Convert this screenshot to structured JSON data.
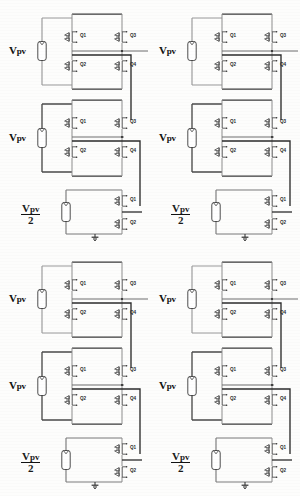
{
  "figure": {
    "background_color": "#fdfdfc",
    "wire_color": "#555555",
    "wire_color_dark": "#2b2b2b",
    "label_color": "#111111",
    "quadrant_count": 4
  },
  "labels": {
    "vpv": "V",
    "vpv_sub": "pv",
    "vpv_full": "Vpv",
    "fraction_numerator": "Vpv",
    "fraction_denominator": "2",
    "q1": "Q1",
    "q2": "Q2",
    "q3": "Q3",
    "q4": "Q4"
  },
  "icons": {
    "ground": "ground-icon",
    "source": "dc-source-icon",
    "mosfet": "mosfet-icon"
  },
  "topologies": [
    {
      "id": "topology-top-left",
      "position": "top-left",
      "stages": [
        {
          "id": "stage-1",
          "type": "full-bridge",
          "source_label": "Vpv",
          "switches": [
            "Q1",
            "Q3",
            "Q2",
            "Q4"
          ]
        },
        {
          "id": "stage-2",
          "type": "full-bridge",
          "source_label": "Vpv",
          "switches": [
            "Q1",
            "Q3",
            "Q2",
            "Q4"
          ]
        },
        {
          "id": "stage-3",
          "type": "half-bridge",
          "source_label": "Vpv/2",
          "switches": [
            "Q1",
            "Q2"
          ],
          "has_ground": true
        }
      ]
    },
    {
      "id": "topology-top-right",
      "position": "top-right",
      "stages": [
        {
          "id": "stage-1",
          "type": "full-bridge",
          "source_label": "Vpv",
          "switches": [
            "Q1",
            "Q3",
            "Q2",
            "Q4"
          ]
        },
        {
          "id": "stage-2",
          "type": "full-bridge",
          "source_label": "Vpv",
          "switches": [
            "Q1",
            "Q3",
            "Q2",
            "Q4"
          ]
        },
        {
          "id": "stage-3",
          "type": "half-bridge",
          "source_label": "Vpv/2",
          "switches": [
            "Q1",
            "Q2"
          ],
          "has_ground": true
        }
      ]
    },
    {
      "id": "topology-bottom-left",
      "position": "bottom-left",
      "stages": [
        {
          "id": "stage-1",
          "type": "full-bridge",
          "source_label": "Vpv",
          "switches": [
            "Q1",
            "Q3",
            "Q2",
            "Q4"
          ]
        },
        {
          "id": "stage-2",
          "type": "full-bridge",
          "source_label": "Vpv",
          "switches": [
            "Q1",
            "Q3",
            "Q2",
            "Q4"
          ]
        },
        {
          "id": "stage-3",
          "type": "half-bridge",
          "source_label": "Vpv/2",
          "switches": [
            "Q1",
            "Q2"
          ],
          "has_ground": true
        }
      ]
    },
    {
      "id": "topology-bottom-right",
      "position": "bottom-right",
      "stages": [
        {
          "id": "stage-1",
          "type": "full-bridge",
          "source_label": "Vpv",
          "switches": [
            "Q1",
            "Q3",
            "Q2",
            "Q4"
          ]
        },
        {
          "id": "stage-2",
          "type": "full-bridge",
          "source_label": "Vpv",
          "switches": [
            "Q1",
            "Q3",
            "Q2",
            "Q4"
          ]
        },
        {
          "id": "stage-3",
          "type": "half-bridge",
          "source_label": "Vpv/2",
          "switches": [
            "Q1",
            "Q2"
          ],
          "has_ground": true
        }
      ]
    }
  ]
}
